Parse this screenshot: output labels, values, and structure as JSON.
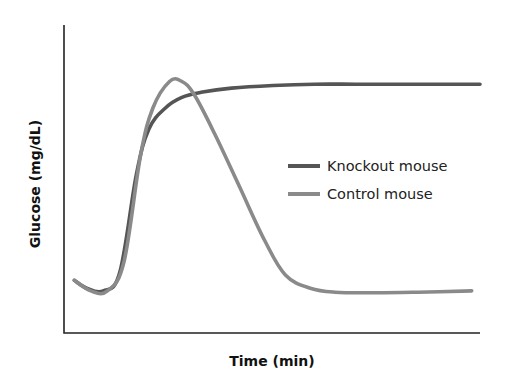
{
  "chart_data": {
    "type": "line",
    "title": "",
    "xlabel": "Time (min)",
    "ylabel": "Glucose (mg/dL)",
    "x_ticks": [],
    "y_ticks": [],
    "grid": false,
    "legend_position": "center-right",
    "units_note": "No numeric ticks shown; values are relative (x: 0-10 arbitrary time units, y: 0-100 relative glucose)",
    "xlim": [
      0,
      10
    ],
    "ylim": [
      0,
      100
    ],
    "series": [
      {
        "name": "Knockout mouse",
        "color": "#555555",
        "x": [
          0.2,
          0.5,
          0.9,
          1.3,
          1.7,
          2.0,
          2.4,
          2.8,
          3.3,
          4.0,
          5.0,
          6.0,
          7.0,
          8.0,
          9.0,
          10.0
        ],
        "y": [
          15,
          12,
          11,
          18,
          55,
          72,
          80,
          84,
          86,
          87.5,
          88.5,
          89,
          89,
          89,
          89,
          89
        ]
      },
      {
        "name": "Control mouse",
        "color": "#8a8a8a",
        "x": [
          0.2,
          0.6,
          1.0,
          1.4,
          1.8,
          2.1,
          2.5,
          2.8,
          3.1,
          3.6,
          4.2,
          4.8,
          5.3,
          5.9,
          6.5,
          7.5,
          8.5,
          9.8
        ],
        "y": [
          15,
          11,
          11,
          22,
          62,
          80,
          90,
          90,
          85,
          70,
          50,
          30,
          17,
          12,
          10.5,
          10.3,
          10.5,
          11
        ]
      }
    ]
  },
  "legend": {
    "items": [
      {
        "label": "Knockout mouse",
        "color": "#555555"
      },
      {
        "label": "Control mouse",
        "color": "#8a8a8a"
      }
    ]
  },
  "axes": {
    "xlabel": "Time (min)",
    "ylabel": "Glucose (mg/dL)"
  }
}
